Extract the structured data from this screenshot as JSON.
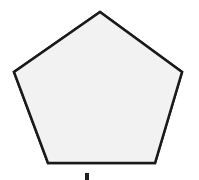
{
  "figure": {
    "canvas": {
      "width": 199,
      "height": 180,
      "background_color": "#ffffff"
    },
    "shape": {
      "name": "pentagon",
      "sides": 5,
      "orientation": "apex-up",
      "regular": true,
      "fill_color": "#f0f0f0",
      "fill_texture": "halftone-dither",
      "stroke_color": "#1a1a1a",
      "stroke_width": 2.5,
      "points": "100,12 182,72 155,163 48,163 14,72",
      "vertices": [
        {
          "label": "apex",
          "x": 100,
          "y": 12
        },
        {
          "label": "right",
          "x": 182,
          "y": 72
        },
        {
          "label": "bottom-right",
          "x": 155,
          "y": 163
        },
        {
          "label": "bottom-left",
          "x": 48,
          "y": 163
        },
        {
          "label": "left",
          "x": 14,
          "y": 72
        }
      ]
    },
    "caption": {
      "visible_text": "",
      "note": "clipped glyph fragment at bottom edge",
      "x": 85,
      "y": 173
    }
  }
}
